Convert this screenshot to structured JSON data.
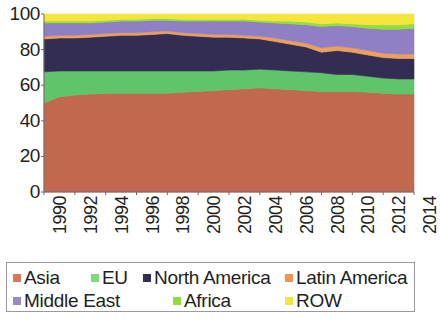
{
  "chart_data": {
    "type": "area",
    "stacked": true,
    "normalized": true,
    "title": "",
    "subtitle": "",
    "xlabel": "",
    "ylabel": "",
    "ylim": [
      0,
      100
    ],
    "ytick_labels": [
      "100",
      "80",
      "60",
      "40",
      "20",
      "0"
    ],
    "ytick_values": [
      100,
      80,
      60,
      40,
      20,
      0
    ],
    "grid": false,
    "legend_position": "bottom",
    "x": [
      1990,
      1991,
      1992,
      1993,
      1994,
      1995,
      1996,
      1997,
      1998,
      1999,
      2000,
      2001,
      2002,
      2003,
      2004,
      2005,
      2006,
      2007,
      2008,
      2009,
      2010,
      2011,
      2012,
      2013,
      2014
    ],
    "xtick_labels": [
      "1990",
      "1992",
      "1994",
      "1996",
      "1998",
      "2000",
      "2002",
      "2004",
      "2006",
      "2008",
      "2010",
      "2012",
      "2014"
    ],
    "xtick_values": [
      1990,
      1992,
      1994,
      1996,
      1998,
      2000,
      2002,
      2004,
      2006,
      2008,
      2010,
      2012,
      2014
    ],
    "series": [
      {
        "name": "Asia",
        "color": "#c0694f",
        "values": [
          50.0,
          53.5,
          54.5,
          55.0,
          55.5,
          55.5,
          55.5,
          55.5,
          55.5,
          56.0,
          56.5,
          57.0,
          57.5,
          58.0,
          58.5,
          58.0,
          57.5,
          57.0,
          56.5,
          56.5,
          56.5,
          56.0,
          55.5,
          55.0,
          55.0
        ]
      },
      {
        "name": "EU",
        "color": "#5fc46a",
        "values": [
          17.5,
          14.5,
          13.5,
          13.0,
          12.5,
          12.5,
          12.5,
          12.5,
          12.5,
          12.0,
          11.5,
          11.0,
          11.0,
          10.5,
          10.5,
          10.5,
          10.5,
          10.5,
          10.5,
          9.5,
          9.5,
          9.0,
          8.5,
          8.5,
          8.5
        ]
      },
      {
        "name": "North America",
        "color": "#332d53",
        "values": [
          18.5,
          18.5,
          18.5,
          19.0,
          19.5,
          20.0,
          20.0,
          20.5,
          21.0,
          20.0,
          19.5,
          19.0,
          18.5,
          18.0,
          17.0,
          16.0,
          15.0,
          14.0,
          11.5,
          13.5,
          12.5,
          12.0,
          11.5,
          11.5,
          11.5
        ]
      },
      {
        "name": "Latin America",
        "color": "#ef9f58",
        "values": [
          1.5,
          1.5,
          1.5,
          1.5,
          1.5,
          1.5,
          1.5,
          1.5,
          1.5,
          1.5,
          1.5,
          1.5,
          1.5,
          1.5,
          1.5,
          2.0,
          2.0,
          2.0,
          2.5,
          2.5,
          2.5,
          2.5,
          2.5,
          2.5,
          2.5
        ]
      },
      {
        "name": "Middle East",
        "color": "#8f7fc4",
        "values": [
          7.5,
          7.0,
          7.0,
          6.5,
          6.5,
          6.5,
          6.5,
          6.5,
          6.0,
          6.5,
          7.0,
          7.5,
          7.5,
          8.0,
          8.0,
          8.5,
          9.5,
          10.5,
          12.0,
          11.5,
          12.0,
          12.5,
          13.5,
          14.0,
          14.5
        ]
      },
      {
        "name": "Africa",
        "color": "#93de3e",
        "values": [
          1.0,
          1.0,
          1.0,
          1.0,
          1.0,
          1.0,
          1.0,
          1.0,
          1.0,
          1.0,
          1.0,
          1.0,
          1.0,
          1.0,
          1.0,
          1.0,
          1.5,
          1.5,
          1.5,
          1.5,
          1.5,
          2.0,
          2.5,
          2.5,
          2.5
        ]
      },
      {
        "name": "ROW",
        "color": "#f5e53c",
        "values": [
          4.0,
          4.0,
          4.0,
          4.0,
          3.5,
          3.0,
          3.0,
          2.5,
          2.5,
          3.0,
          3.0,
          3.0,
          3.0,
          3.0,
          3.5,
          4.0,
          4.0,
          4.5,
          5.5,
          5.0,
          5.5,
          6.0,
          6.0,
          6.0,
          5.5
        ]
      }
    ]
  },
  "legend": {
    "rows": [
      [
        {
          "label": "Asia",
          "color": "#d9775c",
          "x": 0
        },
        {
          "label": "EU",
          "color": "#7ed97f",
          "x": 78
        },
        {
          "label": "North America",
          "color": "#332d53",
          "x": 130
        },
        {
          "label": "Latin America",
          "color": "#f0954e",
          "x": 272
        }
      ],
      [
        {
          "label": "Middle East",
          "color": "#9b87cc",
          "x": 0
        },
        {
          "label": "Africa",
          "color": "#8fdd3f",
          "x": 160
        },
        {
          "label": "ROW",
          "color": "#f5e53c",
          "x": 272
        }
      ]
    ]
  }
}
